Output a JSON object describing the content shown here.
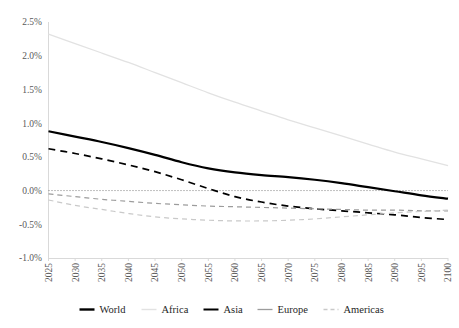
{
  "chart_data": {
    "type": "line",
    "title": "",
    "subtitle": "",
    "xlabel": "",
    "ylabel": "",
    "xlim": [
      2025,
      2100
    ],
    "ylim": [
      -1.0,
      2.5
    ],
    "ytick_values": [
      -1.0,
      -0.5,
      0.0,
      0.5,
      1.0,
      1.5,
      2.0,
      2.5
    ],
    "ytick_labels": [
      "-1.0%",
      "-0.5%",
      "0.0%",
      "0.5%",
      "1.0%",
      "1.5%",
      "2.0%",
      "2.5%"
    ],
    "x": [
      2025,
      2030,
      2035,
      2040,
      2045,
      2050,
      2055,
      2060,
      2065,
      2070,
      2075,
      2080,
      2085,
      2090,
      2095,
      2100
    ],
    "xtick_labels": [
      "2025",
      "2030",
      "2035",
      "2040",
      "2045",
      "2050",
      "2055",
      "2060",
      "2065",
      "2070",
      "2075",
      "2080",
      "2085",
      "2090",
      "2095",
      "2100"
    ],
    "grid": false,
    "zero_line": true,
    "legend_position": "bottom",
    "series": [
      {
        "name": "World",
        "color": "#000000",
        "style": "solid",
        "width": 2.2,
        "values": [
          0.88,
          0.8,
          0.72,
          0.63,
          0.53,
          0.42,
          0.33,
          0.27,
          0.23,
          0.2,
          0.16,
          0.11,
          0.05,
          -0.01,
          -0.07,
          -0.12
        ]
      },
      {
        "name": "Africa",
        "color": "#e2e2e2",
        "style": "solid",
        "width": 1.3,
        "values": [
          2.32,
          2.18,
          2.04,
          1.9,
          1.75,
          1.6,
          1.45,
          1.31,
          1.18,
          1.05,
          0.93,
          0.81,
          0.69,
          0.57,
          0.47,
          0.37
        ]
      },
      {
        "name": "Asia",
        "color": "#000000",
        "style": "dashed",
        "width": 1.7,
        "values": [
          0.62,
          0.55,
          0.47,
          0.38,
          0.28,
          0.16,
          0.03,
          -0.09,
          -0.17,
          -0.23,
          -0.27,
          -0.3,
          -0.33,
          -0.36,
          -0.4,
          -0.43
        ]
      },
      {
        "name": "Europe",
        "color": "#9c9c9c",
        "style": "dashed",
        "width": 1.2,
        "values": [
          -0.05,
          -0.09,
          -0.13,
          -0.16,
          -0.19,
          -0.21,
          -0.23,
          -0.24,
          -0.25,
          -0.26,
          -0.27,
          -0.28,
          -0.29,
          -0.29,
          -0.3,
          -0.3
        ]
      },
      {
        "name": "Americas",
        "color": "#c9c9c9",
        "style": "dashed",
        "width": 1.2,
        "values": [
          -0.14,
          -0.22,
          -0.28,
          -0.34,
          -0.39,
          -0.42,
          -0.44,
          -0.45,
          -0.45,
          -0.44,
          -0.42,
          -0.39,
          -0.36,
          -0.33,
          -0.31,
          -0.29
        ]
      }
    ],
    "legend": [
      {
        "label": "World",
        "color": "#000000",
        "style": "solid",
        "width": 2.4
      },
      {
        "label": "Africa",
        "color": "#e2e2e2",
        "style": "solid",
        "width": 1.4
      },
      {
        "label": "Asia",
        "color": "#000000",
        "style": "solid",
        "width": 2.0
      },
      {
        "label": "Europe",
        "color": "#9c9c9c",
        "style": "solid",
        "width": 1.3
      },
      {
        "label": "Americas",
        "color": "#c9c9c9",
        "style": "dashed",
        "width": 1.3
      }
    ]
  }
}
